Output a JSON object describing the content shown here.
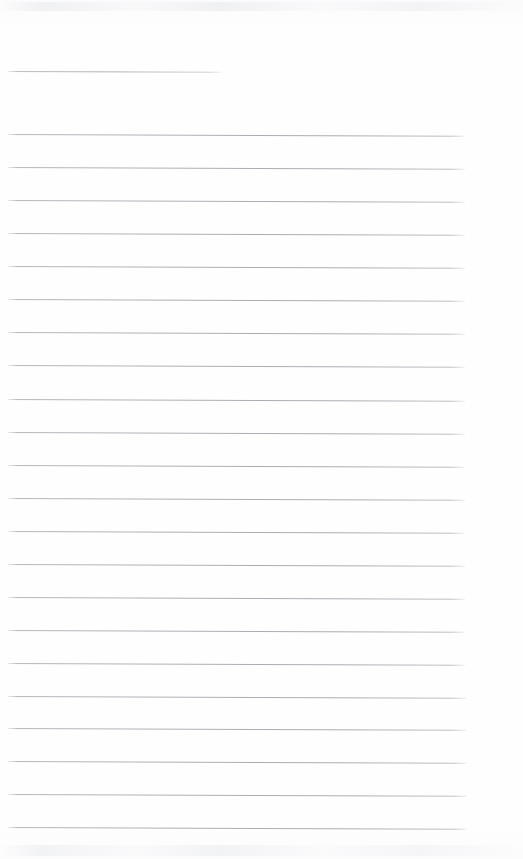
{
  "document": {
    "kind": "scanned-lined-paper",
    "title": "Blank Ruled Notepad Page",
    "page_width": 523,
    "page_height": 859,
    "background_color": "#fefefe",
    "rule_color": "#b0b4b9",
    "rule_thickness": 1,
    "rule_skew_degrees": 0.22,
    "left_margin": 8,
    "right_margin": 57,
    "content_text": "",
    "handwriting_present": false,
    "rule_spacing": 33,
    "rule_count": 24
  },
  "rules": [
    {
      "index": 1,
      "top": 71,
      "left": 8,
      "width": 214,
      "variant": "short"
    },
    {
      "index": 2,
      "top": 134,
      "left": 8,
      "width": 457,
      "variant": "full"
    },
    {
      "index": 3,
      "top": 167,
      "left": 8,
      "width": 457,
      "variant": "full"
    },
    {
      "index": 4,
      "top": 200,
      "left": 8,
      "width": 457,
      "variant": "full"
    },
    {
      "index": 5,
      "top": 233,
      "left": 8,
      "width": 457,
      "variant": "full"
    },
    {
      "index": 6,
      "top": 266,
      "left": 8,
      "width": 457,
      "variant": "full"
    },
    {
      "index": 7,
      "top": 299,
      "left": 8,
      "width": 457,
      "variant": "full"
    },
    {
      "index": 8,
      "top": 332,
      "left": 8,
      "width": 457,
      "variant": "full"
    },
    {
      "index": 9,
      "top": 365,
      "left": 8,
      "width": 457,
      "variant": "full"
    },
    {
      "index": 10,
      "top": 399,
      "left": 8,
      "width": 457,
      "variant": "full"
    },
    {
      "index": 11,
      "top": 432,
      "left": 8,
      "width": 457,
      "variant": "full"
    },
    {
      "index": 12,
      "top": 465,
      "left": 8,
      "width": 457,
      "variant": "full"
    },
    {
      "index": 13,
      "top": 498,
      "left": 8,
      "width": 457,
      "variant": "full"
    },
    {
      "index": 14,
      "top": 531,
      "left": 8,
      "width": 457,
      "variant": "full"
    },
    {
      "index": 15,
      "top": 564,
      "left": 8,
      "width": 457,
      "variant": "full"
    },
    {
      "index": 16,
      "top": 597,
      "left": 8,
      "width": 457,
      "variant": "full"
    },
    {
      "index": 17,
      "top": 630,
      "left": 8,
      "width": 457,
      "variant": "full"
    },
    {
      "index": 18,
      "top": 663,
      "left": 8,
      "width": 457,
      "variant": "full"
    },
    {
      "index": 19,
      "top": 696,
      "left": 8,
      "width": 458,
      "variant": "full"
    },
    {
      "index": 20,
      "top": 728,
      "left": 8,
      "width": 458,
      "variant": "full"
    },
    {
      "index": 21,
      "top": 761,
      "left": 8,
      "width": 459,
      "variant": "full"
    },
    {
      "index": 22,
      "top": 794,
      "left": 8,
      "width": 459,
      "variant": "full"
    },
    {
      "index": 23,
      "top": 827,
      "left": 8,
      "width": 459,
      "variant": "full"
    }
  ]
}
